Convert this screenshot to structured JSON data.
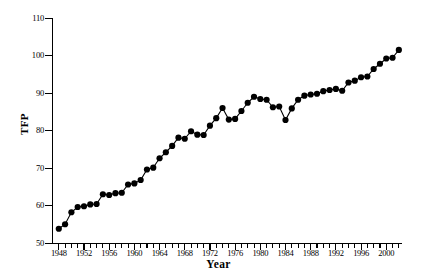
{
  "chart_data": {
    "type": "line",
    "title": "",
    "xlabel": "Year",
    "ylabel": "TFP",
    "xlim": [
      1947,
      2002.5
    ],
    "ylim": [
      50,
      110
    ],
    "grid": false,
    "legend": "none",
    "marker": "filled-circle",
    "xticks_every": 1,
    "xtick_labels": [
      "1948",
      "1952",
      "1956",
      "1960",
      "1964",
      "1968",
      "1972",
      "1976",
      "1980",
      "1984",
      "1988",
      "1992",
      "1996",
      "2000"
    ],
    "xtick_label_years": [
      1948,
      1952,
      1956,
      1960,
      1964,
      1968,
      1972,
      1976,
      1980,
      1984,
      1988,
      1992,
      1996,
      2000
    ],
    "ytick_labels": [
      "50",
      "60",
      "70",
      "80",
      "90",
      "100",
      "110"
    ],
    "ytick_values": [
      50,
      60,
      70,
      80,
      90,
      100,
      110
    ],
    "series_name": "TFP",
    "line_color": "#000000",
    "marker_color": "#000000",
    "x": [
      1948,
      1949,
      1950,
      1951,
      1952,
      1953,
      1954,
      1955,
      1956,
      1957,
      1958,
      1959,
      1960,
      1961,
      1962,
      1963,
      1964,
      1965,
      1966,
      1967,
      1968,
      1969,
      1970,
      1971,
      1972,
      1973,
      1974,
      1975,
      1976,
      1977,
      1978,
      1979,
      1980,
      1981,
      1982,
      1983,
      1984,
      1985,
      1986,
      1987,
      1988,
      1989,
      1990,
      1991,
      1992,
      1993,
      1994,
      1995,
      1996,
      1997,
      1998,
      1999,
      2000,
      2001,
      2002
    ],
    "values": [
      53.8,
      55.0,
      58.2,
      59.6,
      59.8,
      60.3,
      60.4,
      63.0,
      62.8,
      63.3,
      63.4,
      65.6,
      65.9,
      66.8,
      69.6,
      70.1,
      72.6,
      74.2,
      75.9,
      78.1,
      77.8,
      79.8,
      78.9,
      78.8,
      81.3,
      83.3,
      86.0,
      82.9,
      83.1,
      85.2,
      87.4,
      89.0,
      88.4,
      88.2,
      86.2,
      86.4,
      82.8,
      85.9,
      88.2,
      89.3,
      89.6,
      89.8,
      90.5,
      90.8,
      91.1,
      90.6,
      92.8,
      93.3,
      94.2,
      94.4,
      96.4,
      97.8,
      99.2,
      99.4,
      101.5
    ]
  }
}
